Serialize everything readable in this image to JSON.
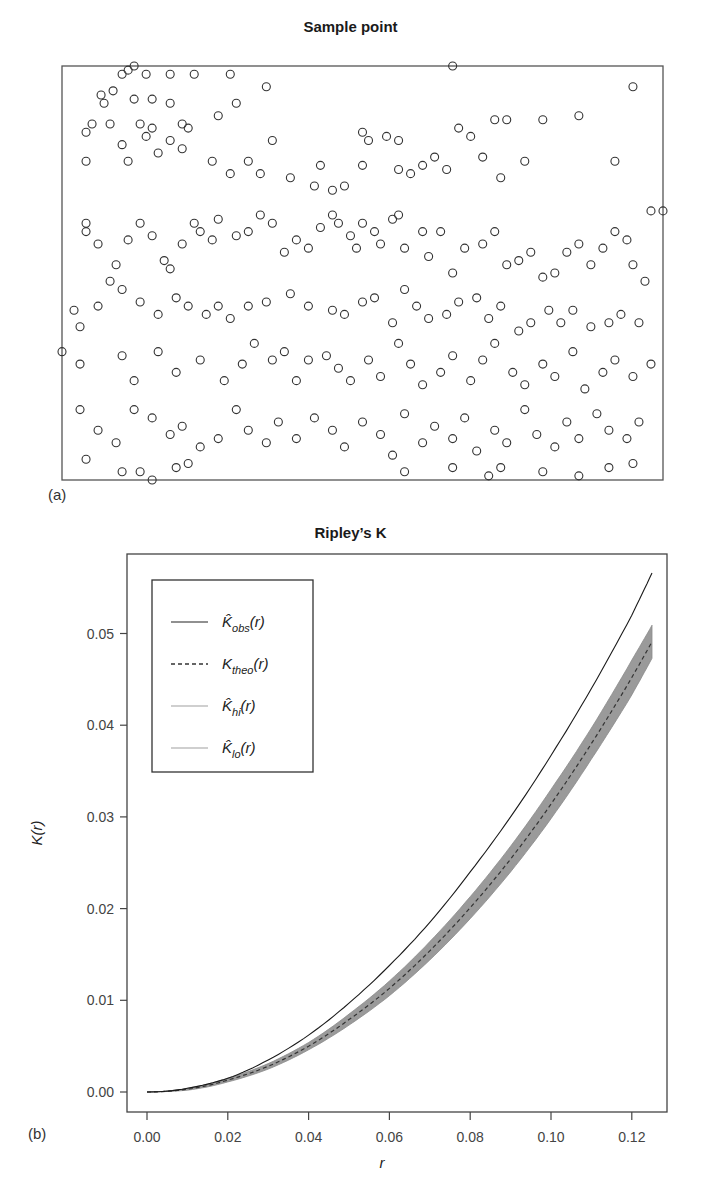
{
  "panel_a": {
    "title": "Sample point",
    "label": "(a)"
  },
  "panel_b": {
    "title": "Ripley’s K",
    "label": "(b)",
    "xlabel": "r",
    "ylabel": "K(r)",
    "legend": [
      {
        "symbol": "K̂",
        "sub": "obs",
        "suffix": "(r)",
        "style": "solid",
        "color": "#222222"
      },
      {
        "symbol": "K",
        "sub": "theo",
        "suffix": "(r)",
        "style": "dashed",
        "color": "#333333"
      },
      {
        "symbol": "K̂",
        "sub": "hi",
        "suffix": "(r)",
        "style": "solid",
        "color": "#a0a0a0"
      },
      {
        "symbol": "K̂",
        "sub": "lo",
        "suffix": "(r)",
        "style": "solid",
        "color": "#a0a0a0"
      }
    ]
  },
  "chart_data": [
    {
      "type": "scatter",
      "title": "Sample point",
      "xlabel": "",
      "ylabel": "",
      "axes_visible": false,
      "marker": "open-circle",
      "note": "approx. 400 points, positions in normalized [0,1] window coords (x right, y up)",
      "points": [
        [
          0.11,
          0.99
        ],
        [
          0.12,
          1.0
        ],
        [
          0.1,
          0.98
        ],
        [
          0.14,
          0.98
        ],
        [
          0.18,
          0.98
        ],
        [
          0.22,
          0.98
        ],
        [
          0.28,
          0.98
        ],
        [
          0.065,
          0.93
        ],
        [
          0.085,
          0.94
        ],
        [
          0.07,
          0.91
        ],
        [
          0.12,
          0.92
        ],
        [
          0.15,
          0.92
        ],
        [
          0.18,
          0.91
        ],
        [
          0.05,
          0.86
        ],
        [
          0.04,
          0.84
        ],
        [
          0.08,
          0.86
        ],
        [
          0.13,
          0.86
        ],
        [
          0.15,
          0.85
        ],
        [
          0.2,
          0.86
        ],
        [
          0.21,
          0.85
        ],
        [
          0.14,
          0.83
        ],
        [
          0.18,
          0.82
        ],
        [
          0.1,
          0.81
        ],
        [
          0.26,
          0.88
        ],
        [
          0.35,
          0.82
        ],
        [
          0.29,
          0.91
        ],
        [
          0.34,
          0.95
        ],
        [
          0.04,
          0.77
        ],
        [
          0.11,
          0.77
        ],
        [
          0.16,
          0.79
        ],
        [
          0.2,
          0.8
        ],
        [
          0.25,
          0.77
        ],
        [
          0.28,
          0.74
        ],
        [
          0.33,
          0.74
        ],
        [
          0.31,
          0.77
        ],
        [
          0.38,
          0.73
        ],
        [
          0.43,
          0.76
        ],
        [
          0.42,
          0.71
        ],
        [
          0.45,
          0.7
        ],
        [
          0.47,
          0.71
        ],
        [
          0.5,
          0.76
        ],
        [
          0.51,
          0.82
        ],
        [
          0.5,
          0.84
        ],
        [
          0.54,
          0.83
        ],
        [
          0.56,
          0.82
        ],
        [
          0.58,
          0.74
        ],
        [
          0.56,
          0.75
        ],
        [
          0.6,
          0.76
        ],
        [
          0.62,
          0.78
        ],
        [
          0.64,
          0.75
        ],
        [
          0.68,
          0.83
        ],
        [
          0.7,
          0.78
        ],
        [
          0.72,
          0.87
        ],
        [
          0.74,
          0.87
        ],
        [
          0.8,
          0.87
        ],
        [
          0.66,
          0.85
        ],
        [
          0.73,
          0.73
        ],
        [
          0.77,
          0.77
        ],
        [
          0.86,
          0.88
        ],
        [
          0.92,
          0.77
        ],
        [
          0.95,
          0.95
        ],
        [
          0.98,
          0.65
        ],
        [
          0.04,
          0.62
        ],
        [
          0.04,
          0.6
        ],
        [
          0.06,
          0.57
        ],
        [
          0.09,
          0.52
        ],
        [
          0.08,
          0.48
        ],
        [
          0.11,
          0.58
        ],
        [
          0.13,
          0.62
        ],
        [
          0.15,
          0.59
        ],
        [
          0.17,
          0.53
        ],
        [
          0.18,
          0.51
        ],
        [
          0.2,
          0.57
        ],
        [
          0.22,
          0.62
        ],
        [
          0.23,
          0.6
        ],
        [
          0.25,
          0.58
        ],
        [
          0.26,
          0.63
        ],
        [
          0.29,
          0.59
        ],
        [
          0.31,
          0.6
        ],
        [
          0.33,
          0.64
        ],
        [
          0.35,
          0.62
        ],
        [
          0.37,
          0.55
        ],
        [
          0.39,
          0.58
        ],
        [
          0.41,
          0.56
        ],
        [
          0.43,
          0.61
        ],
        [
          0.45,
          0.64
        ],
        [
          0.46,
          0.62
        ],
        [
          0.48,
          0.59
        ],
        [
          0.49,
          0.56
        ],
        [
          0.5,
          0.62
        ],
        [
          0.52,
          0.6
        ],
        [
          0.53,
          0.57
        ],
        [
          0.55,
          0.63
        ],
        [
          0.56,
          0.64
        ],
        [
          0.57,
          0.56
        ],
        [
          0.6,
          0.6
        ],
        [
          0.61,
          0.54
        ],
        [
          0.63,
          0.6
        ],
        [
          0.65,
          0.5
        ],
        [
          0.67,
          0.56
        ],
        [
          0.7,
          0.57
        ],
        [
          0.72,
          0.6
        ],
        [
          0.74,
          0.52
        ],
        [
          0.76,
          0.53
        ],
        [
          0.78,
          0.55
        ],
        [
          0.8,
          0.49
        ],
        [
          0.82,
          0.5
        ],
        [
          0.84,
          0.55
        ],
        [
          0.86,
          0.57
        ],
        [
          0.88,
          0.52
        ],
        [
          0.9,
          0.56
        ],
        [
          0.92,
          0.6
        ],
        [
          0.94,
          0.58
        ],
        [
          0.95,
          0.52
        ],
        [
          0.97,
          0.48
        ],
        [
          0.02,
          0.41
        ],
        [
          0.03,
          0.37
        ],
        [
          0.06,
          0.42
        ],
        [
          0.1,
          0.46
        ],
        [
          0.13,
          0.43
        ],
        [
          0.16,
          0.4
        ],
        [
          0.19,
          0.44
        ],
        [
          0.21,
          0.42
        ],
        [
          0.24,
          0.4
        ],
        [
          0.26,
          0.42
        ],
        [
          0.28,
          0.39
        ],
        [
          0.31,
          0.42
        ],
        [
          0.34,
          0.43
        ],
        [
          0.38,
          0.45
        ],
        [
          0.41,
          0.42
        ],
        [
          0.45,
          0.41
        ],
        [
          0.47,
          0.4
        ],
        [
          0.5,
          0.43
        ],
        [
          0.52,
          0.44
        ],
        [
          0.55,
          0.38
        ],
        [
          0.57,
          0.46
        ],
        [
          0.59,
          0.42
        ],
        [
          0.61,
          0.39
        ],
        [
          0.64,
          0.4
        ],
        [
          0.66,
          0.43
        ],
        [
          0.69,
          0.44
        ],
        [
          0.71,
          0.39
        ],
        [
          0.73,
          0.42
        ],
        [
          0.76,
          0.36
        ],
        [
          0.78,
          0.38
        ],
        [
          0.81,
          0.41
        ],
        [
          0.83,
          0.38
        ],
        [
          0.85,
          0.41
        ],
        [
          0.88,
          0.37
        ],
        [
          0.91,
          0.38
        ],
        [
          0.93,
          0.4
        ],
        [
          0.96,
          0.38
        ],
        [
          0.03,
          0.28
        ],
        [
          0.1,
          0.3
        ],
        [
          0.12,
          0.24
        ],
        [
          0.16,
          0.31
        ],
        [
          0.19,
          0.26
        ],
        [
          0.23,
          0.29
        ],
        [
          0.27,
          0.24
        ],
        [
          0.3,
          0.28
        ],
        [
          0.32,
          0.33
        ],
        [
          0.35,
          0.29
        ],
        [
          0.37,
          0.31
        ],
        [
          0.39,
          0.24
        ],
        [
          0.41,
          0.29
        ],
        [
          0.44,
          0.3
        ],
        [
          0.46,
          0.27
        ],
        [
          0.48,
          0.24
        ],
        [
          0.51,
          0.29
        ],
        [
          0.53,
          0.25
        ],
        [
          0.56,
          0.33
        ],
        [
          0.58,
          0.28
        ],
        [
          0.6,
          0.23
        ],
        [
          0.63,
          0.26
        ],
        [
          0.65,
          0.3
        ],
        [
          0.68,
          0.24
        ],
        [
          0.7,
          0.29
        ],
        [
          0.72,
          0.33
        ],
        [
          0.75,
          0.26
        ],
        [
          0.77,
          0.23
        ],
        [
          0.8,
          0.28
        ],
        [
          0.82,
          0.25
        ],
        [
          0.85,
          0.31
        ],
        [
          0.87,
          0.22
        ],
        [
          0.9,
          0.26
        ],
        [
          0.92,
          0.29
        ],
        [
          0.95,
          0.25
        ],
        [
          0.98,
          0.28
        ],
        [
          0.03,
          0.17
        ],
        [
          0.06,
          0.12
        ],
        [
          0.09,
          0.09
        ],
        [
          0.12,
          0.17
        ],
        [
          0.15,
          0.15
        ],
        [
          0.18,
          0.11
        ],
        [
          0.2,
          0.13
        ],
        [
          0.23,
          0.08
        ],
        [
          0.26,
          0.1
        ],
        [
          0.29,
          0.17
        ],
        [
          0.31,
          0.12
        ],
        [
          0.34,
          0.09
        ],
        [
          0.36,
          0.14
        ],
        [
          0.39,
          0.1
        ],
        [
          0.42,
          0.15
        ],
        [
          0.45,
          0.12
        ],
        [
          0.47,
          0.08
        ],
        [
          0.5,
          0.14
        ],
        [
          0.53,
          0.11
        ],
        [
          0.55,
          0.06
        ],
        [
          0.57,
          0.16
        ],
        [
          0.6,
          0.09
        ],
        [
          0.62,
          0.13
        ],
        [
          0.65,
          0.1
        ],
        [
          0.67,
          0.15
        ],
        [
          0.69,
          0.07
        ],
        [
          0.72,
          0.12
        ],
        [
          0.74,
          0.09
        ],
        [
          0.77,
          0.17
        ],
        [
          0.79,
          0.11
        ],
        [
          0.82,
          0.08
        ],
        [
          0.84,
          0.14
        ],
        [
          0.86,
          0.1
        ],
        [
          0.89,
          0.16
        ],
        [
          0.91,
          0.12
        ],
        [
          0.94,
          0.1
        ],
        [
          0.96,
          0.14
        ],
        [
          0.04,
          0.05
        ],
        [
          0.1,
          0.02
        ],
        [
          0.13,
          0.02
        ],
        [
          0.15,
          0.0
        ],
        [
          0.19,
          0.03
        ],
        [
          0.21,
          0.04
        ],
        [
          0.57,
          0.02
        ],
        [
          0.65,
          0.03
        ],
        [
          0.71,
          0.01
        ],
        [
          0.73,
          0.03
        ],
        [
          0.8,
          0.02
        ],
        [
          0.86,
          0.01
        ],
        [
          0.91,
          0.03
        ],
        [
          0.95,
          0.04
        ],
        [
          0.0,
          0.31
        ],
        [
          1.0,
          0.65
        ],
        [
          0.65,
          1.0
        ]
      ]
    },
    {
      "type": "line",
      "title": "Ripley’s K",
      "xlabel": "r",
      "ylabel": "K(r)",
      "xlim": [
        -0.005,
        0.13
      ],
      "ylim": [
        -0.002,
        0.059
      ],
      "x_ticks": [
        "0.00",
        "0.02",
        "0.04",
        "0.06",
        "0.08",
        "0.10",
        "0.12"
      ],
      "y_ticks": [
        "0.00",
        "0.01",
        "0.02",
        "0.03",
        "0.04",
        "0.05"
      ],
      "grid": false,
      "legend_position": "upper left",
      "x": [
        0.0,
        0.01,
        0.02,
        0.03,
        0.04,
        0.05,
        0.06,
        0.07,
        0.08,
        0.09,
        0.1,
        0.11,
        0.12,
        0.125
      ],
      "series": [
        {
          "name": "K_obs(r)",
          "style": "solid",
          "values": [
            0.0,
            0.0004,
            0.0015,
            0.0035,
            0.0062,
            0.0097,
            0.0138,
            0.0185,
            0.024,
            0.03,
            0.0367,
            0.044,
            0.052,
            0.0566
          ]
        },
        {
          "name": "K_theo(r)",
          "style": "dashed",
          "values": [
            0.0,
            0.0003,
            0.0013,
            0.0028,
            0.005,
            0.0079,
            0.0113,
            0.0154,
            0.0201,
            0.0254,
            0.0314,
            0.038,
            0.0452,
            0.0491
          ]
        },
        {
          "name": "K_hi(r)",
          "style": "envelope",
          "values": [
            0.0,
            0.0004,
            0.0015,
            0.0031,
            0.0054,
            0.0085,
            0.0121,
            0.0164,
            0.0213,
            0.0268,
            0.033,
            0.0397,
            0.0471,
            0.0509
          ]
        },
        {
          "name": "K_lo(r)",
          "style": "envelope",
          "values": [
            0.0,
            0.0002,
            0.0011,
            0.0025,
            0.0046,
            0.0073,
            0.0105,
            0.0144,
            0.0189,
            0.024,
            0.0298,
            0.0363,
            0.0433,
            0.0473
          ]
        }
      ]
    }
  ]
}
